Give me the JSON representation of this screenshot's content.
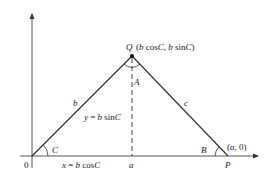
{
  "diagram": {
    "type": "triangle-coordinate-geometry",
    "points": {
      "origin": {
        "label": "0"
      },
      "Q": {
        "label": "Q",
        "coords": "(b cosC, b sinC)"
      },
      "P": {
        "label": "P",
        "coords": "(a, 0)"
      }
    },
    "angles": {
      "C": "C",
      "A": "A",
      "B": "B"
    },
    "sides": {
      "b": "b",
      "c": "c"
    },
    "annotations": {
      "height": "y = b sinC",
      "base_x": "x = b cosC",
      "foot": "a"
    },
    "colors": {
      "line": "#333333",
      "axis": "#444444",
      "text": "#222222"
    }
  }
}
